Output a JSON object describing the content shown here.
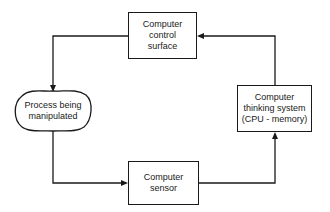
{
  "diagram": {
    "type": "closed-loop block diagram",
    "nodes": {
      "control_surface": {
        "lines": [
          "Computer",
          "control",
          "surface"
        ]
      },
      "process": {
        "lines": [
          "Process being",
          "manipulated"
        ]
      },
      "sensor": {
        "lines": [
          "Computer",
          "sensor"
        ]
      },
      "thinking": {
        "lines": [
          "Computer",
          "thinking system",
          "(CPU - memory)"
        ]
      }
    },
    "edges": [
      {
        "from": "control_surface",
        "to": "process"
      },
      {
        "from": "process",
        "to": "sensor"
      },
      {
        "from": "sensor",
        "to": "thinking"
      },
      {
        "from": "thinking",
        "to": "control_surface"
      }
    ],
    "line_color": "#1a1a1a"
  }
}
